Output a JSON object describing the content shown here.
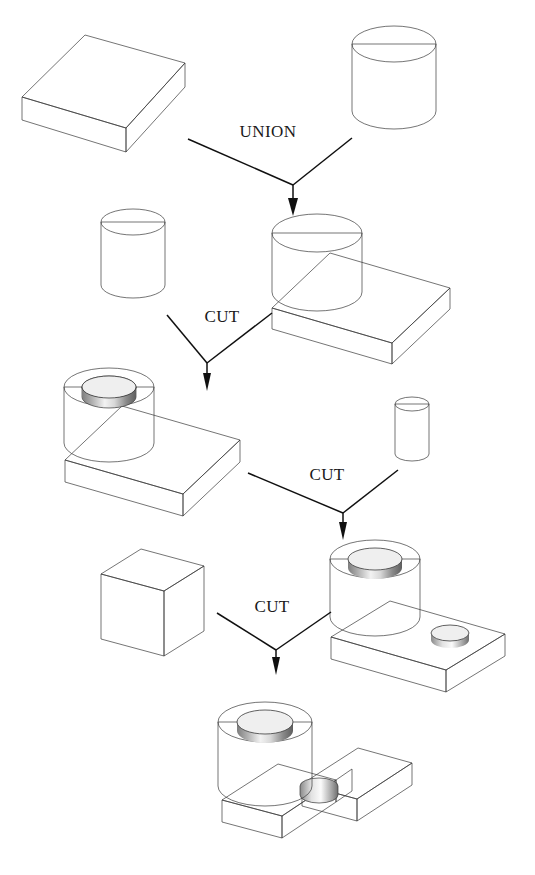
{
  "figure": {
    "background_color": "#ffffff",
    "line_color": "#101010",
    "palette": {
      "top_face_dark": "#6e6e6e",
      "top_face_mid": "#7d7d7d",
      "front_face_light": "#b4b4b4",
      "side_face_mid": "#8d8d8d",
      "cyl_shadow": "#4f4f4f",
      "cyl_highlight": "#ffffff",
      "cyl_mid": "#9a9a9a",
      "bore_dark": "#5a5a5a",
      "bore_light": "#e8e8e8"
    }
  },
  "operations": [
    {
      "id": "op-union",
      "label": "UNION",
      "x": 268,
      "y": 137
    },
    {
      "id": "op-cut-1",
      "label": "CUT",
      "x": 222,
      "y": 322
    },
    {
      "id": "op-cut-2",
      "label": "CUT",
      "x": 327,
      "y": 480
    },
    {
      "id": "op-cut-3",
      "label": "CUT",
      "x": 272,
      "y": 612
    }
  ],
  "nodes": [
    {
      "id": "node-block-base",
      "name": "rectangular-block",
      "role": "operand",
      "row": 1,
      "side": "left"
    },
    {
      "id": "node-cylinder-big",
      "name": "large-cylinder",
      "role": "operand",
      "row": 1,
      "side": "right"
    },
    {
      "id": "node-cylinder-bore",
      "name": "bore-cylinder",
      "role": "operand",
      "row": 2,
      "side": "left"
    },
    {
      "id": "node-union-result",
      "name": "block-with-boss",
      "role": "result",
      "row": 2,
      "side": "right"
    },
    {
      "id": "node-ring-result",
      "name": "block-with-bored-boss",
      "role": "result",
      "row": 3,
      "side": "left"
    },
    {
      "id": "node-cylinder-small",
      "name": "small-pin-cylinder",
      "role": "operand",
      "row": 3,
      "side": "right"
    },
    {
      "id": "node-slab-cutter",
      "name": "slot-cutter-block",
      "role": "operand",
      "row": 4,
      "side": "left"
    },
    {
      "id": "node-hole-result",
      "name": "part-with-small-hole",
      "role": "result",
      "row": 4,
      "side": "right"
    },
    {
      "id": "node-final",
      "name": "final-slotted-part",
      "role": "result",
      "row": 5,
      "side": "center"
    }
  ]
}
